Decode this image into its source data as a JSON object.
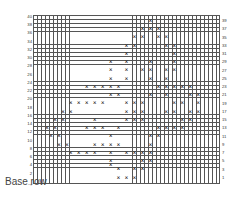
{
  "chart_data": {
    "type": "table",
    "title": "",
    "grid": {
      "columns": 47,
      "rows": 41,
      "grid_lines": true
    },
    "row_labels_left": [
      "40",
      "38",
      "36",
      "34",
      "32",
      "30",
      "28",
      "26",
      "24",
      "22",
      "20",
      "18",
      "16",
      "14",
      "12",
      "10",
      "8",
      "6",
      "4",
      "2"
    ],
    "row_labels_right": [
      "39",
      "37",
      "35",
      "33",
      "31",
      "29",
      "27",
      "25",
      "23",
      "21",
      "19",
      "17",
      "15",
      "13",
      "11",
      "9",
      "7",
      "5",
      "3",
      "1"
    ],
    "base_row_label": "Base row",
    "base_row_arrow": "→",
    "mark_symbol": "×",
    "marks_by_row_index": [
      {
        "r": 1,
        "cols": [
          29
        ]
      },
      {
        "r": 3,
        "cols": [
          27,
          29,
          31
        ]
      },
      {
        "r": 5,
        "cols": [
          25,
          27,
          31,
          33
        ]
      },
      {
        "r": 7,
        "cols": [
          23,
          25,
          33,
          35
        ]
      },
      {
        "r": 9,
        "cols": [
          23,
          35
        ]
      },
      {
        "r": 11,
        "cols": [
          19,
          23,
          29,
          35
        ]
      },
      {
        "r": 13,
        "cols": [
          19,
          23,
          27,
          29,
          33,
          35
        ]
      },
      {
        "r": 15,
        "cols": [
          19,
          23,
          29,
          33
        ]
      },
      {
        "r": 17,
        "cols": [
          13,
          15,
          17,
          19,
          21,
          31,
          33,
          35,
          37,
          39
        ]
      },
      {
        "r": 19,
        "cols": [
          19,
          21,
          29,
          33,
          39,
          41
        ]
      },
      {
        "r": 21,
        "cols": [
          9,
          11,
          13,
          15,
          17,
          23,
          25,
          27,
          35,
          37,
          41
        ]
      },
      {
        "r": 23,
        "cols": [
          7,
          9,
          23,
          25,
          27,
          33,
          35,
          39,
          41
        ]
      },
      {
        "r": 25,
        "cols": [
          5,
          7,
          15,
          23,
          25,
          27,
          37,
          39
        ]
      },
      {
        "r": 27,
        "cols": [
          3,
          5,
          13,
          15,
          17,
          21,
          31,
          33,
          35,
          37
        ]
      },
      {
        "r": 29,
        "cols": [
          4,
          6,
          19,
          29,
          31
        ]
      },
      {
        "r": 31,
        "cols": [
          6,
          8,
          15,
          17,
          19,
          21,
          29
        ]
      },
      {
        "r": 33,
        "cols": [
          9,
          11,
          13,
          15,
          19,
          23,
          25,
          27,
          29
        ]
      },
      {
        "r": 35,
        "cols": [
          19,
          27,
          29
        ]
      },
      {
        "r": 36,
        "cols": [
          19
        ]
      },
      {
        "r": 37,
        "cols": [
          21,
          25,
          27
        ]
      },
      {
        "r": 39,
        "cols": [
          21,
          23,
          25
        ]
      }
    ]
  }
}
